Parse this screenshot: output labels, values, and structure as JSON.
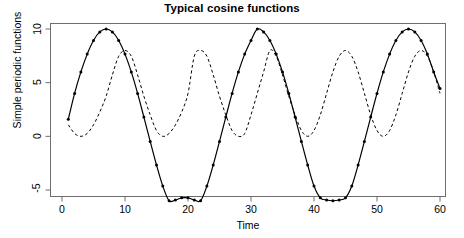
{
  "chart_data": {
    "type": "line",
    "title": "Typical cosine functions",
    "xlabel": "Time",
    "ylabel": "Simple periodic functions",
    "xlim": [
      1,
      60
    ],
    "ylim": [
      -6.1,
      10.2
    ],
    "grid": false,
    "legend": "none",
    "xticks": [
      0,
      10,
      20,
      30,
      40,
      50,
      60
    ],
    "yticks": [
      -5,
      0,
      5,
      10
    ],
    "x": [
      1,
      2,
      3,
      4,
      5,
      6,
      7,
      8,
      9,
      10,
      11,
      12,
      13,
      14,
      15,
      16,
      17,
      18,
      19,
      20,
      21,
      22,
      23,
      24,
      25,
      26,
      27,
      28,
      29,
      30,
      31,
      32,
      33,
      34,
      35,
      36,
      37,
      38,
      39,
      40,
      41,
      42,
      43,
      44,
      45,
      46,
      47,
      48,
      49,
      50,
      51,
      52,
      53,
      54,
      55,
      56,
      57,
      58,
      59,
      60
    ],
    "series": [
      {
        "name": "solid",
        "style": "solid-with-points",
        "color": "#000000",
        "marker": "filled-circle",
        "formula": "2 + 8*cos(2*pi*(t-7)/24)",
        "values": [
          1.59,
          4.0,
          6.0,
          7.66,
          8.93,
          9.73,
          10.0,
          9.73,
          8.93,
          7.66,
          6.0,
          4.0,
          1.79,
          -0.47,
          -2.67,
          -4.63,
          -6.0,
          -5.93,
          -5.73,
          -5.73,
          -5.93,
          -6.0,
          -4.63,
          -2.67,
          -0.47,
          1.79,
          4.0,
          6.0,
          7.66,
          8.93,
          10.0,
          9.73,
          8.93,
          7.66,
          6.0,
          4.0,
          1.79,
          -0.47,
          -2.67,
          -4.63,
          -5.73,
          -5.93,
          -6.0,
          -5.93,
          -5.73,
          -4.63,
          -2.67,
          -0.47,
          1.79,
          4.0,
          6.0,
          7.66,
          8.93,
          9.73,
          10.0,
          9.73,
          8.93,
          7.66,
          6.0,
          4.45
        ]
      },
      {
        "name": "dashed",
        "style": "dashed",
        "color": "#000000",
        "marker": "none",
        "formula": "4 + 4*cos(2*pi*(t-9)/12)",
        "values": [
          1.07,
          0.27,
          0.0,
          0.27,
          1.07,
          2.27,
          3.73,
          5.73,
          7.46,
          8.0,
          7.46,
          5.73,
          3.73,
          2.0,
          0.54,
          0.0,
          0.27,
          1.07,
          2.27,
          4.0,
          7.46,
          8.0,
          7.46,
          5.73,
          3.73,
          2.0,
          0.54,
          0.0,
          0.27,
          2.0,
          4.0,
          6.0,
          8.0,
          7.46,
          5.73,
          3.73,
          2.0,
          0.54,
          0.0,
          0.54,
          2.0,
          4.0,
          6.0,
          7.46,
          8.0,
          7.46,
          6.0,
          4.0,
          2.0,
          0.54,
          0.0,
          0.54,
          2.0,
          4.0,
          6.0,
          7.46,
          8.0,
          7.46,
          6.0,
          4.0
        ]
      }
    ]
  },
  "axis": {
    "y_tick_labels": [
      "10",
      "5",
      "0",
      "-5"
    ],
    "x_tick_labels": [
      "0",
      "10",
      "20",
      "30",
      "40",
      "50",
      "60"
    ]
  }
}
